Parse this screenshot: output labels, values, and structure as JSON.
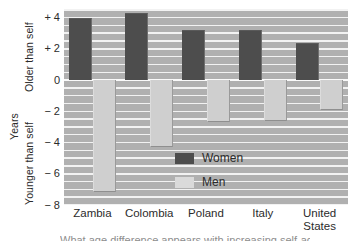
{
  "chart_data": {
    "type": "bar",
    "title": "",
    "xlabel": "",
    "ylabel": "Years",
    "ylim": [
      -8,
      5
    ],
    "grid": true,
    "legend_position": "inside-lower-right",
    "categories": [
      "Zambia",
      "Colombia",
      "Poland",
      "Italy",
      "United States"
    ],
    "category_lines": [
      [
        "Zambia"
      ],
      [
        "Colombia"
      ],
      [
        "Poland"
      ],
      [
        "Italy"
      ],
      [
        "United",
        "States"
      ]
    ],
    "series": [
      {
        "name": "Women",
        "color": "#4d4d4d",
        "values": [
          4.0,
          4.3,
          3.2,
          3.2,
          2.4
        ]
      },
      {
        "name": "Men",
        "color": "#cfcfcf",
        "values": [
          -7.2,
          -4.3,
          -2.7,
          -2.6,
          -1.9
        ]
      }
    ],
    "yticks": [
      "+ 4",
      "+ 2",
      "0",
      "− 2",
      "− 4",
      "− 6",
      "− 8"
    ],
    "ytick_values": [
      4,
      2,
      0,
      -2,
      -4,
      -6,
      -8
    ],
    "annotations": {
      "axis_upper": "Older than self",
      "axis_lower": "Younger than self"
    }
  },
  "axis": {
    "years": "Years",
    "older": "Older than self",
    "younger": "Younger than self"
  },
  "legend": {
    "women": "Women",
    "men": "Men"
  },
  "caption": "What age difference appears with increasing self-age"
}
